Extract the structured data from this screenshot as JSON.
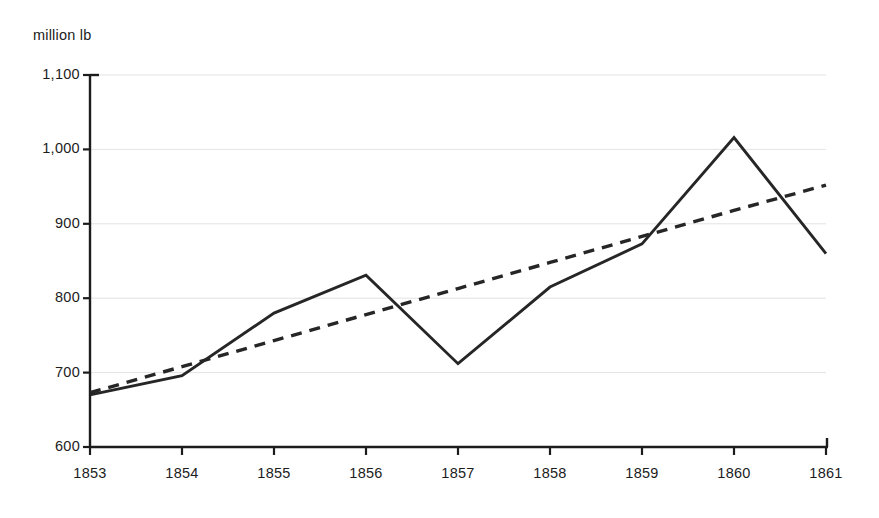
{
  "chart_data": {
    "type": "line",
    "title": "",
    "subtitle": "",
    "xlabel": "",
    "ylabel": "million lb",
    "unit_label": "million lb",
    "categories": [
      "1853",
      "1854",
      "1855",
      "1856",
      "1857",
      "1858",
      "1859",
      "1860",
      "1861"
    ],
    "x": [
      1853,
      1854,
      1855,
      1856,
      1857,
      1858,
      1859,
      1860,
      1861
    ],
    "xlim": [
      1853,
      1861
    ],
    "ylim": [
      600,
      1100
    ],
    "y_ticks": [
      600,
      700,
      800,
      900,
      1000,
      1100
    ],
    "y_tick_labels": [
      "600",
      "700",
      "800",
      "900",
      "1,000",
      "1,100"
    ],
    "x_tick_labels": [
      "1853",
      "1854",
      "1855",
      "1856",
      "1857",
      "1858",
      "1859",
      "1860",
      "1861"
    ],
    "grid": "horizontal",
    "legend": "none",
    "annotations": [],
    "series": [
      {
        "name": "actual",
        "style": "solid",
        "color": "#262626",
        "values": [
          670,
          696,
          780,
          831,
          712,
          815,
          873,
          1016,
          860
        ]
      },
      {
        "name": "trend",
        "style": "dashed",
        "color": "#262626",
        "values": [
          673,
          708,
          743,
          778,
          813,
          848,
          883,
          918,
          952
        ]
      }
    ]
  },
  "colors": {
    "background": "#ffffff",
    "axis": "#1c1c1c",
    "gridline": "#e3e3e3",
    "line": "#262626",
    "text": "#1c1c1c"
  },
  "geometry": {
    "plot_left": 90,
    "plot_right": 826,
    "plot_top": 75,
    "plot_bottom": 447
  }
}
